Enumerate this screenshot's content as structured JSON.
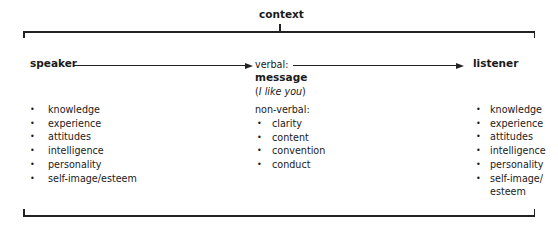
{
  "diagram": {
    "title": "context",
    "nodes": {
      "speaker": "speaker",
      "message_prefix": "verbal:",
      "message": "message",
      "message_example_open": "(",
      "message_example": "I like you",
      "message_example_close": ")",
      "listener": "listener"
    },
    "speaker_attributes": [
      "knowledge",
      "experience",
      "attitudes",
      "intelligence",
      "personality",
      "self-image/esteem"
    ],
    "nonverbal": {
      "label": "non-verbal:",
      "items": [
        "clarity",
        "content",
        "convention",
        "conduct"
      ]
    },
    "listener_attributes": [
      "knowledge",
      "experience",
      "attitudes",
      "intelligence",
      "personality",
      "self-image/",
      "esteem"
    ],
    "edges": [
      {
        "from": "speaker",
        "to": "message"
      },
      {
        "from": "message",
        "to": "listener"
      }
    ],
    "colors": {
      "line": "#222222",
      "text": "#1a1a1a",
      "background": "#ffffff"
    }
  }
}
